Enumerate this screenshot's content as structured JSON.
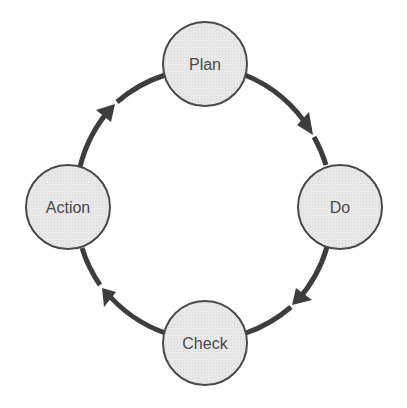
{
  "diagram": {
    "type": "cycle",
    "colors": {
      "node_fill": "#e6e6e6",
      "node_stroke": "#4a4a4a",
      "arrow": "#3d3d3d",
      "text": "#4a4a4a",
      "background": "#ffffff"
    },
    "nodes": [
      {
        "id": "plan",
        "label": "Plan"
      },
      {
        "id": "do",
        "label": "Do"
      },
      {
        "id": "check",
        "label": "Check"
      },
      {
        "id": "action",
        "label": "Action"
      }
    ],
    "edges": [
      {
        "from": "plan",
        "to": "do",
        "direction": "clockwise"
      },
      {
        "from": "do",
        "to": "check",
        "direction": "clockwise"
      },
      {
        "from": "check",
        "to": "action",
        "direction": "clockwise"
      },
      {
        "from": "action",
        "to": "plan",
        "direction": "clockwise"
      }
    ]
  }
}
